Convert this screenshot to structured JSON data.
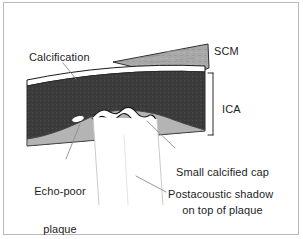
{
  "figure": {
    "kind": "carotid-ultrasound-schematic",
    "width": 303,
    "height": 239
  },
  "labels": {
    "calcification": "Calcification",
    "scm": "SCM",
    "ica": "ICA",
    "calcified_cap_line1": "Small calcified cap",
    "calcified_cap_line2": "on top of plaque",
    "echo_poor_line1": "Echo-poor",
    "echo_poor_line2": "plaque",
    "postacoustic_shadow": "Postacoustic shadow"
  },
  "structures": [
    {
      "name": "sternocleidomastoid-muscle",
      "label": "SCM",
      "tone": "mid-gray"
    },
    {
      "name": "arterial-wall-lumen",
      "label": "ICA",
      "tone": "dark-gray"
    },
    {
      "name": "calcification-band",
      "label": "Calcification",
      "tone": "white"
    },
    {
      "name": "echo-poor-plaque",
      "label": "Echo-poor plaque",
      "tone": "light-gray"
    },
    {
      "name": "calcified-cap",
      "label": "Small calcified cap on top of plaque",
      "tone": "white"
    },
    {
      "name": "postacoustic-shadow",
      "label": "Postacoustic shadow",
      "tone": "white"
    }
  ],
  "colors": {
    "frame": "#b9b9b9",
    "background": "#ffffff",
    "lumen_dark": "#3c3c3c",
    "lumen_dark_edge": "#2a2a2a",
    "muscle_gray": "#a8a8a8",
    "plaque_gray": "#b4b4b4",
    "calcification_white": "#ffffff",
    "outline": "#1a1a1a",
    "leader_line": "#8c8c8c",
    "text": "#1d1d1d"
  }
}
